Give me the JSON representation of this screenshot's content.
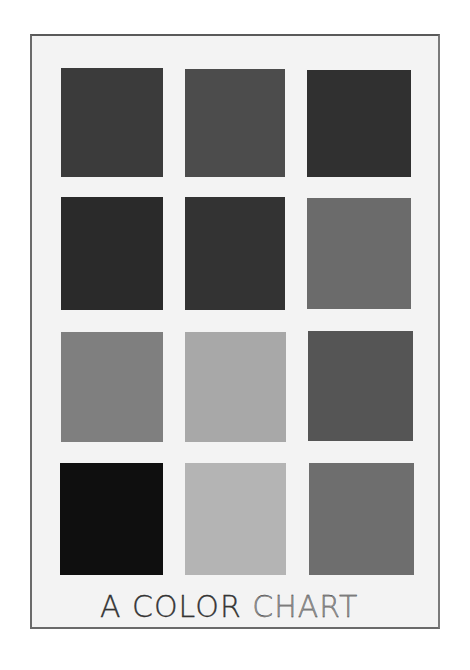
{
  "artwork": {
    "title": "A COLOR CHART",
    "caption_parts": [
      "A COLOR",
      "CHART"
    ],
    "board_color": "#f3f3f3",
    "border_color": "#6a6a6a"
  },
  "swatches": [
    {
      "row": 1,
      "col": 1,
      "color": "#3b3b3b",
      "x": 61,
      "y": 68,
      "w": 102,
      "h": 109
    },
    {
      "row": 1,
      "col": 2,
      "color": "#4c4c4c",
      "x": 185,
      "y": 69,
      "w": 100,
      "h": 108
    },
    {
      "row": 1,
      "col": 3,
      "color": "#303030",
      "x": 307,
      "y": 70,
      "w": 104,
      "h": 107
    },
    {
      "row": 2,
      "col": 1,
      "color": "#2a2a2a",
      "x": 61,
      "y": 197,
      "w": 102,
      "h": 113
    },
    {
      "row": 2,
      "col": 2,
      "color": "#333333",
      "x": 185,
      "y": 197,
      "w": 100,
      "h": 113
    },
    {
      "row": 2,
      "col": 3,
      "color": "#6b6b6b",
      "x": 307,
      "y": 198,
      "w": 104,
      "h": 111
    },
    {
      "row": 3,
      "col": 1,
      "color": "#7f7f7f",
      "x": 61,
      "y": 332,
      "w": 102,
      "h": 110
    },
    {
      "row": 3,
      "col": 2,
      "color": "#a8a8a8",
      "x": 185,
      "y": 332,
      "w": 101,
      "h": 110
    },
    {
      "row": 3,
      "col": 3,
      "color": "#555555",
      "x": 308,
      "y": 331,
      "w": 105,
      "h": 110
    },
    {
      "row": 4,
      "col": 1,
      "color": "#0f0f0f",
      "x": 60,
      "y": 463,
      "w": 103,
      "h": 112
    },
    {
      "row": 4,
      "col": 2,
      "color": "#b4b4b4",
      "x": 185,
      "y": 463,
      "w": 101,
      "h": 112
    },
    {
      "row": 4,
      "col": 3,
      "color": "#6e6e6e",
      "x": 309,
      "y": 463,
      "w": 105,
      "h": 112
    }
  ]
}
